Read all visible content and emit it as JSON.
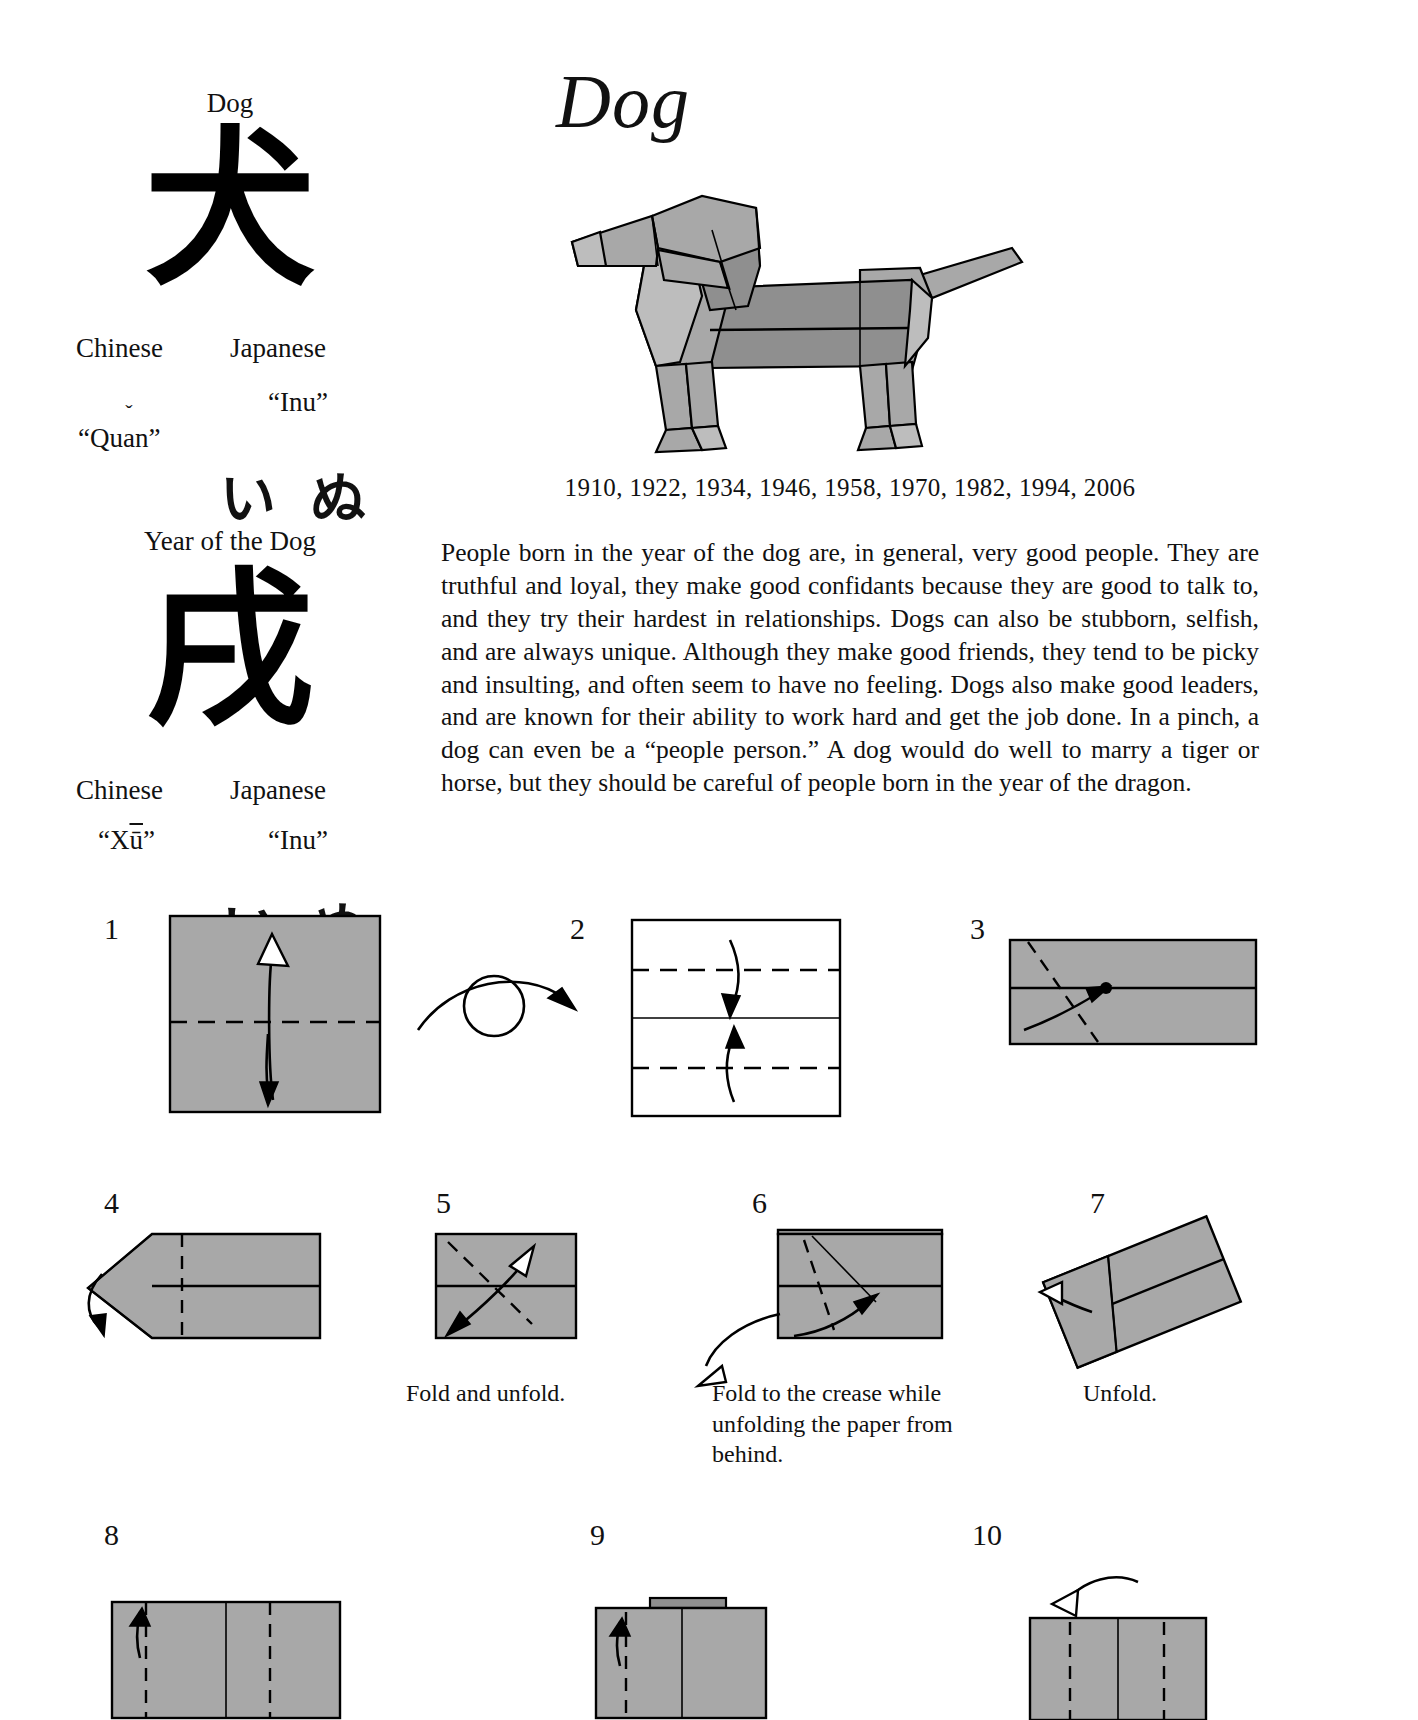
{
  "left_column": {
    "animal_block": {
      "title": "Dog",
      "kanji": "犬",
      "chinese_label": "Chinese",
      "chinese_romanization": "“Qu",
      "chinese_romanization_caron": "a",
      "chinese_romanization_tail": "n”",
      "japanese_label": "Japanese",
      "japanese_romanization": "“Inu”",
      "kana_1": "い",
      "kana_2": "ぬ"
    },
    "year_block": {
      "title": "Year of the Dog",
      "kanji": "戌",
      "chinese_label": "Chinese",
      "chinese_romanization_pre": "“X",
      "chinese_romanization_macron": "ū",
      "chinese_romanization_post": "”",
      "japanese_label": "Japanese",
      "japanese_romanization": "“Inu”",
      "kana_1": "い",
      "kana_2": "ぬ"
    }
  },
  "right_column": {
    "heading": "Dog",
    "model_alt": "origami dog standing in profile facing left",
    "years": "1910, 1922, 1934, 1946, 1958, 1970, 1982, 1994, 2006",
    "description": "People born in the year of the dog are, in general, very good people. They are truthful and loyal, they make good confidants because they are good to talk to, and they try their hardest in relationships. Dogs can also be stubborn, selfish, and are always unique. Although they make good friends, they tend to be picky and insulting, and often seem to have no feeling. Dogs also make good leaders, and are known for their ability to work hard and get the job done. In a pinch, a dog can even be a “people person.” A dog would do well to marry a tiger or horse, but they should be careful of people born in the year of the dragon."
  },
  "steps": [
    {
      "number": "1",
      "caption": ""
    },
    {
      "number": "2",
      "caption": ""
    },
    {
      "number": "3",
      "caption": ""
    },
    {
      "number": "4",
      "caption": ""
    },
    {
      "number": "5",
      "caption": "Fold and unfold."
    },
    {
      "number": "6",
      "caption": "Fold to the crease while unfolding the paper from behind."
    },
    {
      "number": "7",
      "caption": "Unfold."
    },
    {
      "number": "8",
      "caption": ""
    },
    {
      "number": "9",
      "caption": ""
    },
    {
      "number": "10",
      "caption": ""
    }
  ],
  "colors": {
    "paper_front": "#a8a8a8",
    "paper_back": "#ffffff",
    "paper_shadow": "#8f8f8f",
    "ink": "#000000",
    "page_bg": "#ffffff"
  }
}
